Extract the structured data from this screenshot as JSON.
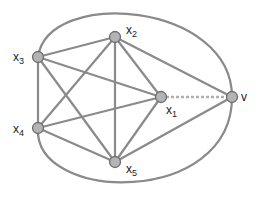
{
  "diagram": {
    "type": "graph",
    "colors": {
      "edge": "#8a8a8a",
      "node_fill": "#b4b4b4",
      "node_stroke": "#6e6e6e",
      "dashed_edge": "#b0b0b0",
      "label": "#222222"
    },
    "nodes": [
      {
        "id": "x1",
        "base": "x",
        "sub": "1",
        "x": 161,
        "y": 97,
        "lx": 166,
        "ly": 104
      },
      {
        "id": "x2",
        "base": "x",
        "sub": "2",
        "x": 115,
        "y": 37,
        "lx": 126,
        "ly": 24
      },
      {
        "id": "x3",
        "base": "x",
        "sub": "3",
        "x": 38,
        "y": 57,
        "lx": 13,
        "ly": 51
      },
      {
        "id": "x4",
        "base": "x",
        "sub": "4",
        "x": 38,
        "y": 128,
        "lx": 13,
        "ly": 123
      },
      {
        "id": "x5",
        "base": "x",
        "sub": "5",
        "x": 115,
        "y": 162,
        "lx": 126,
        "ly": 163
      },
      {
        "id": "v",
        "base": "v",
        "sub": "",
        "x": 232,
        "y": 97,
        "lx": 241,
        "ly": 91
      }
    ],
    "edges": [
      [
        "x2",
        "x3"
      ],
      [
        "x2",
        "x4"
      ],
      [
        "x2",
        "x5"
      ],
      [
        "x2",
        "x1"
      ],
      [
        "x2",
        "v"
      ],
      [
        "x3",
        "x4"
      ],
      [
        "x3",
        "x1"
      ],
      [
        "x3",
        "x5"
      ],
      [
        "x4",
        "x1"
      ],
      [
        "x4",
        "x5"
      ],
      [
        "x5",
        "x1"
      ],
      [
        "x5",
        "v"
      ]
    ],
    "dashed_edges": [
      [
        "x1",
        "v"
      ]
    ],
    "outer_curve": {
      "from": "x3",
      "through": "v",
      "to": "x4"
    }
  }
}
